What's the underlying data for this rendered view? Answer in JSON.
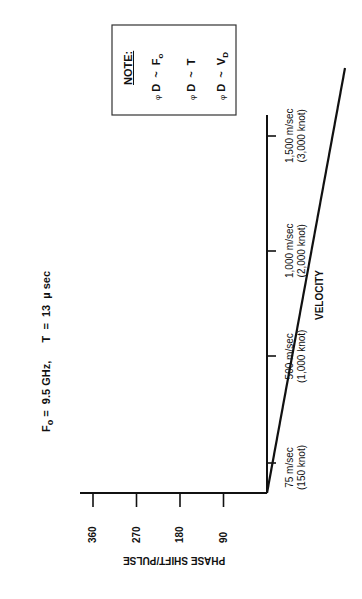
{
  "chart_data": {
    "type": "line",
    "orientation": "rotated -90deg (page printed sideways)",
    "parameters": {
      "Fo": "9.5 GHz",
      "T": "13 µ sec"
    },
    "xlabel": "VELOCITY",
    "ylabel": "PHASE SHIFT/PULSE",
    "x_ticks": [
      {
        "value": 75,
        "label": "75 m/sec",
        "sublabel": "(150 knot)"
      },
      {
        "value": 500,
        "label": "500 m/sec",
        "sublabel": "(1,000 knot)"
      },
      {
        "value": 1000,
        "label": "1,000 m/sec",
        "sublabel": "(2,000 knot)"
      },
      {
        "value": 1500,
        "label": "1,500 m/sec",
        "sublabel": "(3,000 knot)"
      }
    ],
    "y_ticks": [
      90,
      180,
      270,
      360
    ],
    "series": [
      {
        "name": "phase shift per pulse",
        "x": [
          0,
          1785
        ],
        "y": [
          0,
          383
        ]
      }
    ],
    "xlim": [
      0,
      1590
    ],
    "ylim": [
      0,
      385
    ],
    "grid": false,
    "legend": null,
    "annotation": {
      "title": "NOTE:",
      "lines": [
        {
          "lhs": "φ",
          "sub": "D",
          "rel": "~",
          "rhs": "F",
          "rhs_sub": "o"
        },
        {
          "lhs": "φ",
          "sub": "D",
          "rel": "~",
          "rhs": "T",
          "rhs_sub": ""
        },
        {
          "lhs": "φ",
          "sub": "D",
          "rel": "~",
          "rhs": "V",
          "rhs_sub": "D"
        }
      ]
    }
  },
  "labels": {
    "title_fo": "F",
    "title_fo_sub": "o",
    "title_rest": "=  9.5 GHz,      T  =  13  µ sec",
    "xlabel": "VELOCITY",
    "ylabel": "PHASE SHIFT/PULSE",
    "note_title": "NOTE:"
  }
}
